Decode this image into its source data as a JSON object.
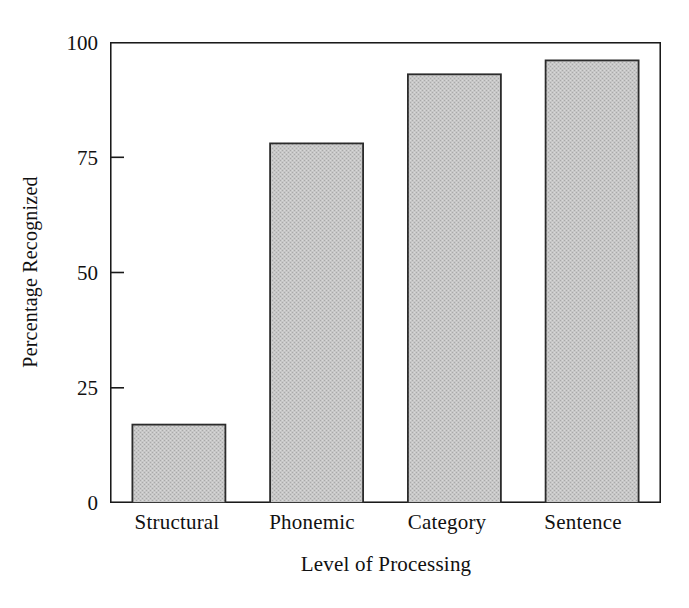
{
  "chart_data": {
    "type": "bar",
    "title": "",
    "subtitle": "",
    "xlabel": "Level of Processing",
    "ylabel": "Percentage Recognized",
    "categories": [
      "Structural",
      "Phonemic",
      "Category",
      "Sentence"
    ],
    "values": [
      17,
      78,
      93,
      96
    ],
    "ylim": [
      0,
      100
    ],
    "yticks": [
      0,
      25,
      50,
      75,
      100
    ],
    "ytick_labels": [
      "0",
      "25",
      "50",
      "75",
      "100"
    ],
    "grid": false,
    "legend": null,
    "legend_position": "none",
    "annotations": [],
    "series": [
      {
        "name": "Percentage Recognized",
        "values": [
          17,
          78,
          93,
          96
        ]
      }
    ]
  },
  "style": {
    "bar_fill": "#c2c2c2",
    "bar_edge": "#2b2b2b",
    "axis_color": "#1a1a1a",
    "background": "#ffffff",
    "text_color": "#111111"
  },
  "axis": {
    "x_title": "Level of Processing",
    "y_title": "Percentage Recognized",
    "y_tick_labels": [
      "100",
      "75",
      "50",
      "25",
      "0"
    ],
    "x_tick_labels": [
      "Structural",
      "Phonemic",
      "Category",
      "Sentence"
    ]
  }
}
